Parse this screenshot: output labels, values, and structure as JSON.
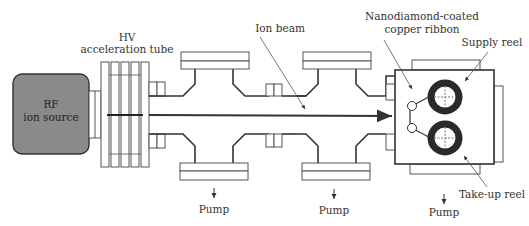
{
  "diagram": {
    "type": "schematic",
    "title": "",
    "components": {
      "ion_source": {
        "label_line1": "RF",
        "label_line2": "ion source",
        "fill": "#8a8a8a"
      },
      "acceleration_tube": {
        "label_line1": "HV",
        "label_line2": "acceleration tube",
        "plates": 5
      },
      "ion_beam": {
        "label": "Ion beam"
      },
      "ribbon": {
        "label_line1": "Nanodiamond-coated",
        "label_line2": "copper ribbon"
      },
      "supply_reel": {
        "label": "Supply reel"
      },
      "takeup_reel": {
        "label": "Take-up reel"
      },
      "pumps": [
        {
          "label": "Pump"
        },
        {
          "label": "Pump"
        },
        {
          "label": "Pump"
        }
      ]
    },
    "colors": {
      "line": "#333333",
      "reel": "#2a2a2a",
      "source_fill": "#8a8a8a",
      "background": "#ffffff"
    }
  }
}
